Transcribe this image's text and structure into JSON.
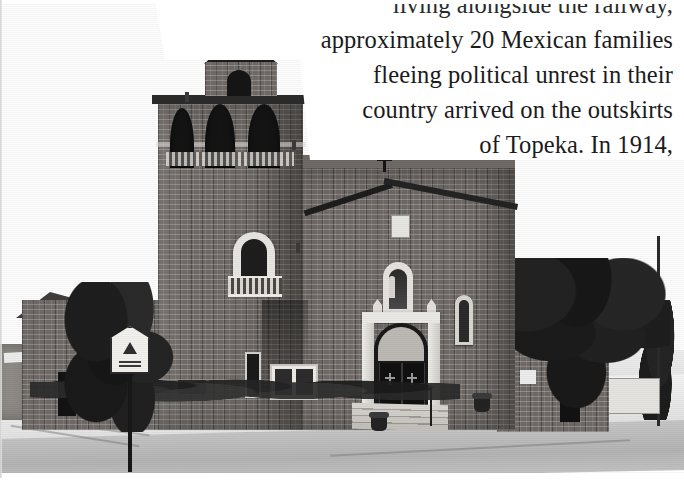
{
  "document": {
    "kind": "scanned-book-page",
    "page_background": "#ffffff",
    "ink_color": "#1b1b1b"
  },
  "body_text": {
    "alignment": "right",
    "lines": [
      {
        "id": "line-0",
        "text": "living alongside the railway,",
        "clipped_at_top": true
      },
      {
        "id": "line-1",
        "text": "approximately 20 Mexican families",
        "clipped_at_top": false
      },
      {
        "id": "line-2",
        "text": "fleeing political unrest in their",
        "clipped_at_top": false
      },
      {
        "id": "line-3",
        "text": "country arrived on the outskirts",
        "clipped_at_top": false
      },
      {
        "id": "line-4",
        "text": "of Topeka. In 1914,",
        "clipped_at_top": false
      }
    ]
  },
  "photograph": {
    "caption_visible": false,
    "tone": "black-and-white",
    "subject": "brick Catholic church with bell tower on a street corner",
    "elements": {
      "bell_tower": "bell-tower",
      "tower_cross": "cross-icon",
      "gable_cross": "cross-icon",
      "cupola": "cupola",
      "belfry_openings": 3,
      "statue_niche": "statue-niche",
      "entrance_doors": "double-doors",
      "entrance_steps": "entrance-steps",
      "street_sign": "street-sign",
      "left_annex": "annex-building",
      "right_annex": "side-annex-building",
      "trees": 3,
      "street": "street",
      "sidewalk": "sidewalk"
    }
  },
  "colors": {
    "paper": "#ffffff",
    "ink": "#1b1b1b",
    "brick_midtone": "#6f6a66",
    "shadow": "#141414",
    "stone_trim": "#e9e6e2",
    "pavement": "#d9d9d9"
  }
}
